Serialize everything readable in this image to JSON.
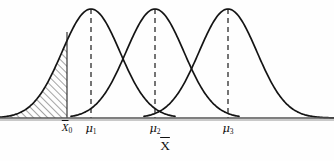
{
  "figure": {
    "title": "",
    "background_color": "#fefefe",
    "ink_color": "#141414",
    "axis_label": "X",
    "axis_label_overbar": true,
    "axis": {
      "y": 118,
      "x_start": 0,
      "x_end": 334,
      "color": "#4a4a4a"
    },
    "markers": [
      {
        "id": "x0",
        "label_main": "X",
        "label_sub": "0",
        "overbar": true,
        "x": 67,
        "line_style": "solid",
        "line_top": 32
      },
      {
        "id": "mu1",
        "label_main": "μ",
        "label_sub": "1",
        "overbar": false,
        "x": 91,
        "line_style": "dashed",
        "line_top": 9
      },
      {
        "id": "mu2",
        "label_main": "μ",
        "label_sub": "2",
        "overbar": false,
        "x": 155,
        "line_style": "dashed",
        "line_top": 9
      },
      {
        "id": "mu3",
        "label_main": "μ",
        "label_sub": "3",
        "overbar": false,
        "x": 228,
        "line_style": "dashed",
        "line_top": 9
      }
    ],
    "shaded_region": {
      "name": "alpha-rejection-region",
      "fill_pattern": "diagonal-hatch",
      "from_x": 0,
      "to_x": 67,
      "description": "hatched left tail area of first distribution up to X-zero"
    }
  },
  "chart_data": {
    "type": "line",
    "title": "",
    "xlabel": "X̄",
    "ylabel": "",
    "xlim": [
      0,
      334
    ],
    "ylim": [
      0,
      1
    ],
    "grid": false,
    "legend": null,
    "annotations": [
      {
        "text": "X̄0",
        "x": 67,
        "y": 0
      },
      {
        "text": "μ1",
        "x": 91,
        "y": 0
      },
      {
        "text": "μ2",
        "x": 155,
        "y": 0
      },
      {
        "text": "μ3",
        "x": 228,
        "y": 0
      }
    ],
    "series": [
      {
        "name": "distribution-1",
        "kind": "normal-density",
        "mean": 91,
        "peak_y": 9,
        "baseline_y": 118,
        "half_width": 84,
        "x_start": 0,
        "x_end": 175
      },
      {
        "name": "distribution-2",
        "kind": "normal-density",
        "mean": 155,
        "peak_y": 9,
        "baseline_y": 118,
        "half_width": 84,
        "x_start": 71,
        "x_end": 239
      },
      {
        "name": "distribution-3",
        "kind": "normal-density",
        "mean": 228,
        "peak_y": 9,
        "baseline_y": 118,
        "half_width": 84,
        "x_start": 144,
        "x_end": 334
      }
    ]
  }
}
